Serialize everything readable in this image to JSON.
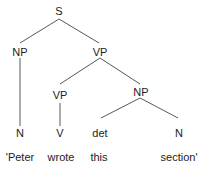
{
  "tree": {
    "nodes": [
      {
        "id": "S",
        "label": "S",
        "x": 59,
        "y": 5
      },
      {
        "id": "NP1",
        "label": "NP",
        "x": 20,
        "y": 45
      },
      {
        "id": "VP1",
        "label": "VP",
        "x": 100,
        "y": 45
      },
      {
        "id": "VP2",
        "label": "VP",
        "x": 60,
        "y": 90
      },
      {
        "id": "NP2",
        "label": "NP",
        "x": 141,
        "y": 85
      },
      {
        "id": "N1",
        "label": "N",
        "x": 20,
        "y": 127
      },
      {
        "id": "V",
        "label": "V",
        "x": 60,
        "y": 127
      },
      {
        "id": "det",
        "label": "det",
        "x": 100,
        "y": 127
      },
      {
        "id": "N2",
        "label": "N",
        "x": 179,
        "y": 127
      }
    ],
    "words": [
      {
        "label": "'Peter",
        "x": 20,
        "y": 151
      },
      {
        "label": "wrote",
        "x": 61,
        "y": 151
      },
      {
        "label": "this",
        "x": 99,
        "y": 151
      },
      {
        "label": "section'",
        "x": 179,
        "y": 151
      }
    ],
    "edges": [
      {
        "from": "S",
        "to": "NP1",
        "x1": 59,
        "y1": 19,
        "x2": 20,
        "y2": 43
      },
      {
        "from": "S",
        "to": "VP1",
        "x1": 59,
        "y1": 19,
        "x2": 99,
        "y2": 43
      },
      {
        "from": "NP1",
        "to": "N1",
        "x1": 20,
        "y1": 58,
        "x2": 20,
        "y2": 126
      },
      {
        "from": "VP1",
        "to": "VP2",
        "x1": 100,
        "y1": 58,
        "x2": 60,
        "y2": 84
      },
      {
        "from": "VP1",
        "to": "NP2",
        "x1": 100,
        "y1": 58,
        "x2": 140,
        "y2": 84
      },
      {
        "from": "VP2",
        "to": "V",
        "x1": 60,
        "y1": 103,
        "x2": 60,
        "y2": 126
      },
      {
        "from": "NP2",
        "to": "det",
        "x1": 140,
        "y1": 98,
        "x2": 101,
        "y2": 118
      },
      {
        "from": "NP2",
        "to": "N2",
        "x1": 140,
        "y1": 98,
        "x2": 178,
        "y2": 118
      }
    ],
    "line_color": "#444444"
  }
}
